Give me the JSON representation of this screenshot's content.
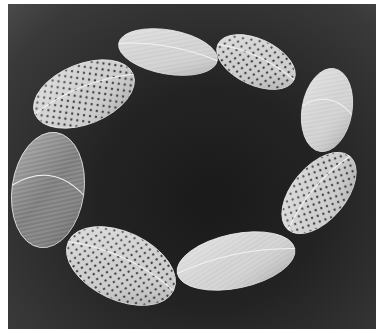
{
  "image": {
    "subject": "silver necklace of eight oval leaf-shaped links on dark background",
    "background_color": "#232323",
    "metal_color": "#d8d8d8",
    "links": [
      {
        "id": 1,
        "texture": "brushed",
        "cx": 160,
        "cy": 48,
        "rx": 50,
        "ry": 22,
        "rot": 10
      },
      {
        "id": 2,
        "texture": "perforated",
        "cx": 248,
        "cy": 58,
        "rx": 42,
        "ry": 23,
        "rot": 25
      },
      {
        "id": 3,
        "texture": "brushed",
        "cx": 319,
        "cy": 106,
        "rx": 25,
        "ry": 42,
        "rot": 10
      },
      {
        "id": 4,
        "texture": "perforated",
        "cx": 311,
        "cy": 189,
        "rx": 48,
        "ry": 27,
        "rot": -50
      },
      {
        "id": 5,
        "texture": "brushed",
        "cx": 228,
        "cy": 257,
        "rx": 60,
        "ry": 27,
        "rot": -12
      },
      {
        "id": 6,
        "texture": "perforated",
        "cx": 113,
        "cy": 262,
        "rx": 58,
        "ry": 34,
        "rot": 25
      },
      {
        "id": 7,
        "texture": "brushed-dark",
        "cx": 40,
        "cy": 186,
        "rx": 36,
        "ry": 58,
        "rot": 8
      },
      {
        "id": 8,
        "texture": "perforated",
        "cx": 76,
        "cy": 90,
        "rx": 53,
        "ry": 30,
        "rot": -22
      }
    ]
  }
}
